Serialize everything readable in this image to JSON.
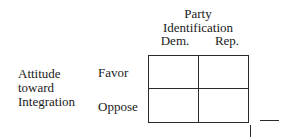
{
  "column_header": {
    "title_line1": "Party",
    "title_line2": "Identification",
    "columns": [
      "Dem.",
      "Rep."
    ]
  },
  "row_header": {
    "title_lines": [
      "Attitude",
      "toward",
      "Integration"
    ],
    "rows": [
      "Favor",
      "Oppose"
    ]
  },
  "table": {
    "cells": [
      [
        "",
        ""
      ],
      [
        "",
        ""
      ]
    ]
  }
}
